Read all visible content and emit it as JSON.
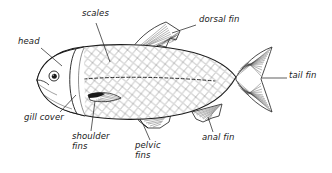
{
  "diagram": {
    "background_color": "#ffffff",
    "ink_color": "#1a1a1a",
    "width": 332,
    "height": 173
  },
  "labels": [
    {
      "id": "head",
      "text": "head",
      "x": 18,
      "y": 38,
      "lines": [
        "head"
      ]
    },
    {
      "id": "scales",
      "text": "scales",
      "x": 82,
      "y": 10,
      "lines": [
        "scales"
      ]
    },
    {
      "id": "dorsal-fin",
      "text": "dorsal fin",
      "x": 199,
      "y": 16,
      "lines": [
        "dorsal fin"
      ]
    },
    {
      "id": "tail-fin",
      "text": "tail fin",
      "x": 289,
      "y": 72,
      "lines": [
        "tail fin"
      ]
    },
    {
      "id": "gill-cover",
      "text": "gill cover",
      "x": 24,
      "y": 114,
      "lines": [
        "gill cover"
      ]
    },
    {
      "id": "shoulder-fins",
      "text": "shoulder fins",
      "x": 72,
      "y": 133,
      "lines": [
        "shoulder",
        "fins"
      ]
    },
    {
      "id": "pelvic-fins",
      "text": "pelvic fins",
      "x": 135,
      "y": 142,
      "lines": [
        "pelvic",
        "fins"
      ]
    },
    {
      "id": "anal-fin",
      "text": "anal fin",
      "x": 202,
      "y": 134,
      "lines": [
        "anal fin"
      ]
    }
  ],
  "parts": [
    {
      "id": "body",
      "name": "fish body"
    },
    {
      "id": "head-region",
      "name": "head"
    },
    {
      "id": "eye",
      "name": "eye"
    },
    {
      "id": "gill-cover",
      "name": "gill cover (operculum)"
    },
    {
      "id": "scales",
      "name": "scales"
    },
    {
      "id": "lateral-line",
      "name": "lateral line"
    },
    {
      "id": "dorsal-fin",
      "name": "dorsal fin"
    },
    {
      "id": "tail-fin",
      "name": "tail fin (caudal fin)"
    },
    {
      "id": "anal-fin",
      "name": "anal fin"
    },
    {
      "id": "pelvic-fins",
      "name": "pelvic fins"
    },
    {
      "id": "shoulder-fins",
      "name": "shoulder fins (pectoral fins)"
    }
  ]
}
